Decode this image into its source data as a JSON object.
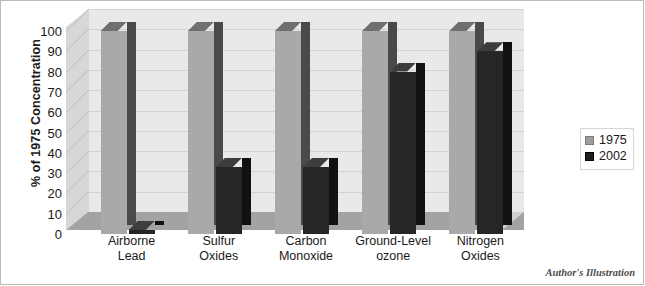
{
  "chart_data": {
    "type": "bar",
    "title": "",
    "subtitle": "",
    "xlabel": "",
    "ylabel": "% of 1975 Concentration",
    "ylim": [
      0,
      100
    ],
    "yticks": [
      0,
      10,
      20,
      30,
      40,
      50,
      60,
      70,
      80,
      90,
      100
    ],
    "grid": true,
    "legend_position": "right",
    "categories": [
      "Airborne Lead",
      "Sulfur Oxides",
      "Carbon Monoxide",
      "Ground-Level ozone",
      "Nitrogen Oxides"
    ],
    "category_lines": [
      [
        "Airborne",
        "Lead"
      ],
      [
        "Sulfur",
        "Oxides"
      ],
      [
        "Carbon",
        "Monoxide"
      ],
      [
        "Ground-Level",
        "ozone"
      ],
      [
        "Nitrogen",
        "Oxides"
      ]
    ],
    "series": [
      {
        "name": "1975",
        "color": "#a9a9a9",
        "values": [
          100,
          100,
          100,
          100,
          100
        ]
      },
      {
        "name": "2002",
        "color": "#262626",
        "values": [
          2,
          33,
          33,
          80,
          90
        ]
      }
    ]
  },
  "legend": {
    "items": [
      {
        "label": "1975",
        "swatch": "legend-swatch-1975"
      },
      {
        "label": "2002",
        "swatch": "legend-swatch-2002"
      }
    ]
  },
  "credit": {
    "text": "Author's Illustration"
  },
  "colors": {
    "series_1975": "#a9a9a9",
    "series_2002": "#262626",
    "back_wall": "#e9e9e9",
    "side_wall": "#d7d7d7",
    "floor": "#a3a3a3",
    "gridline": "#d2d2d2",
    "text": "#1a1a1a"
  }
}
